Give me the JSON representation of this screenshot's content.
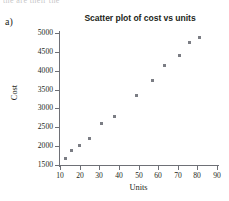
{
  "page": {
    "clipped_top_text": "the are their the",
    "part_label": "a)"
  },
  "chart_data": {
    "type": "scatter",
    "title": "Scatter plot of cost vs units",
    "xlabel": "Units",
    "ylabel": "Cost",
    "xlim": [
      10,
      90
    ],
    "ylim": [
      1500,
      5000
    ],
    "xticks": [
      10,
      20,
      30,
      40,
      50,
      60,
      70,
      80,
      90
    ],
    "yticks": [
      1500,
      2000,
      2500,
      3000,
      3500,
      4000,
      4500,
      5000
    ],
    "xtick_labels": [
      "10",
      "20",
      "30",
      "40",
      "50",
      "60",
      "70",
      "80",
      "90"
    ],
    "ytick_labels": [
      "1500",
      "2000",
      "2500",
      "3000",
      "3500",
      "4000",
      "4500",
      "5000"
    ],
    "grid": false,
    "legend": false,
    "marker_color": "#7b7d84",
    "axis_color": "#6e7076",
    "series": [
      {
        "name": "cost vs units",
        "x": [
          13,
          16,
          20,
          25,
          31,
          38,
          49,
          57,
          63,
          71,
          76,
          81
        ],
        "y": [
          1680,
          1890,
          2010,
          2190,
          2600,
          2780,
          3330,
          3750,
          4130,
          4400,
          4740,
          4880
        ]
      }
    ]
  }
}
